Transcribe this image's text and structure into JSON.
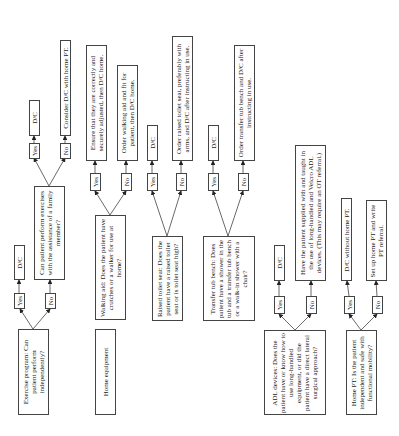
{
  "diagram": {
    "orientation": "rotated-90-ccw",
    "nodes": {
      "exercise_program": "Exercise program: Can patient perform independently?",
      "exercise_yes": "Yes",
      "exercise_no": "No",
      "exercise_dc": "D/C",
      "family_assist": "Can patient perform exercises with the assistance of a family member?",
      "family_yes": "Yes",
      "family_no": "No",
      "family_dc": "D/C",
      "family_consider": "Consider D/C with home PT.",
      "home_equipment": "Home equipment",
      "walking_aid": "Walking aid: Does the patient have crutches or a walker for use at home?",
      "walking_yes": "Yes",
      "walking_no": "No",
      "walking_ensure": "Ensure that they are correctly and securely adjusted, then D/C home.",
      "walking_order": "Order walking aid and fit for patient, then D/C home.",
      "toilet_seat": "Raised toilet seat: Does the patient have a raised toilet seat or is toilet seat high?",
      "toilet_yes": "Yes",
      "toilet_no": "No",
      "toilet_dc": "D/C",
      "toilet_order": "Order raised toilet seat, preferably with arms, and D/C after instructing in use.",
      "tub_bench": "Transfer tub bench: Does patient have a shower in the tub and a transfer tub bench or a walk-in shower with a chair?",
      "tub_yes": "Yes",
      "tub_no": "No",
      "tub_dc": "D/C",
      "tub_order": "Order transfer tub bench and D/C after instructing in use.",
      "adl_devices": "ADL devices: Does the patient have or know how to use long-handled equipment, or did the patient have a direct lateral surgical approach?",
      "adl_yes": "Yes",
      "adl_no": "No",
      "adl_dc": "D/C",
      "adl_supply": "Have the patient supplied with and taught in the use of long-handled and Velcro ADL devices. (This may require an OT referral.)",
      "home_pt": "Home PT: Is the patient independent and safe with functional mobility?",
      "pt_yes": "Yes",
      "pt_no": "No",
      "pt_dc": "D/C without home PT.",
      "pt_setup": "Set up home PT and write PT referral."
    }
  }
}
